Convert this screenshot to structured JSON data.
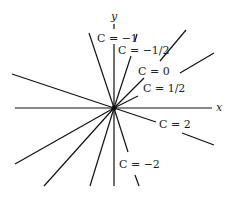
{
  "figure": {
    "type": "family-of-lines-through-origin",
    "axes": {
      "x_label": "x",
      "y_label": "y"
    },
    "center": [
      114,
      108
    ],
    "lines": [
      {
        "C": "-1",
        "x1": 90,
        "y1": 33,
        "x2": 139,
        "y2": 186
      },
      {
        "C": "-1/2",
        "x1": 114,
        "y1": 45,
        "x2": 114,
        "y2": 186
      },
      {
        "C": "0",
        "x1": 186,
        "y1": 30,
        "x2": 44,
        "y2": 186
      },
      {
        "C": "1/2",
        "x1": 214,
        "y1": 53,
        "x2": 15,
        "y2": 164
      },
      {
        "C": "2",
        "x1": 12,
        "y1": 74,
        "x2": 214,
        "y2": 145
      },
      {
        "C": "-2",
        "x1": 139,
        "y1": 35,
        "x2": 90,
        "y2": 186
      }
    ],
    "labels": [
      {
        "text": "C = −1",
        "x": 97,
        "y": 42
      },
      {
        "text": "C = −1/2",
        "x": 118,
        "y": 54
      },
      {
        "text": "C = 0",
        "x": 138,
        "y": 75
      },
      {
        "text": "C = 1/2",
        "x": 143,
        "y": 92
      },
      {
        "text": "C = 2",
        "x": 159,
        "y": 128
      },
      {
        "text": "C = −2",
        "x": 119,
        "y": 168
      }
    ]
  }
}
